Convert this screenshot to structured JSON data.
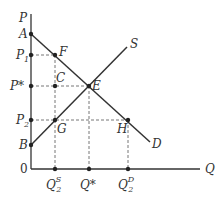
{
  "axes": {
    "y_label": "P",
    "x_label": "Q",
    "origin": "0"
  },
  "points": {
    "A": "A",
    "B": "B",
    "C": "C",
    "E": "E",
    "F": "F",
    "G": "G",
    "H": "H"
  },
  "price_labels": {
    "p1": "P",
    "p1_sub": "1",
    "pstar": "P*",
    "p2": "P",
    "p2_sub": "2"
  },
  "quantity_labels": {
    "qs": "Q",
    "qs_sub": "2",
    "qs_sup": "S",
    "qstar": "Q*",
    "qd": "Q",
    "qd_sub": "2",
    "qd_sup": "D"
  },
  "curves": {
    "supply": "S",
    "demand": "D"
  },
  "colors": {
    "line": "#333333",
    "dash": "#666666"
  }
}
